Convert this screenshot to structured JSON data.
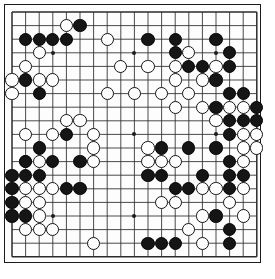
{
  "app": {
    "title": "Go board position",
    "board_type": "go-board",
    "size": 19
  },
  "board": {
    "columns": 19,
    "rows": 19,
    "line_color": "#2a2a2a",
    "border_color": "#1c1c1c",
    "background_color": "#fdfdfd",
    "black_color": "#151515",
    "white_color": "#ffffff",
    "origin_x": 7,
    "origin_y": 7,
    "spacing": 13.6,
    "stone_radius": 6.6,
    "star_points": [
      [
        4,
        4
      ],
      [
        10,
        4
      ],
      [
        16,
        4
      ],
      [
        4,
        10
      ],
      [
        10,
        10
      ],
      [
        16,
        10
      ],
      [
        4,
        16
      ],
      [
        10,
        16
      ],
      [
        16,
        16
      ]
    ]
  },
  "stones": {
    "black": [
      [
        6,
        2
      ],
      [
        2,
        3
      ],
      [
        3,
        3
      ],
      [
        4,
        3
      ],
      [
        5,
        3
      ],
      [
        11,
        3
      ],
      [
        13,
        3
      ],
      [
        16,
        3
      ],
      [
        13,
        4
      ],
      [
        17,
        4
      ],
      [
        14,
        5
      ],
      [
        15,
        5
      ],
      [
        17,
        5
      ],
      [
        2,
        6
      ],
      [
        16,
        6
      ],
      [
        3,
        7
      ],
      [
        17,
        7
      ],
      [
        18,
        7
      ],
      [
        16,
        8
      ],
      [
        19,
        8
      ],
      [
        17,
        9
      ],
      [
        18,
        9
      ],
      [
        19,
        9
      ],
      [
        5,
        10
      ],
      [
        17,
        10
      ],
      [
        3,
        11
      ],
      [
        12,
        11
      ],
      [
        14,
        11
      ],
      [
        16,
        11
      ],
      [
        2,
        12
      ],
      [
        4,
        12
      ],
      [
        6,
        12
      ],
      [
        17,
        12
      ],
      [
        1,
        13
      ],
      [
        2,
        13
      ],
      [
        3,
        13
      ],
      [
        11,
        13
      ],
      [
        12,
        13
      ],
      [
        15,
        13
      ],
      [
        17,
        13
      ],
      [
        18,
        13
      ],
      [
        1,
        14
      ],
      [
        5,
        14
      ],
      [
        6,
        14
      ],
      [
        13,
        14
      ],
      [
        14,
        14
      ],
      [
        17,
        14
      ],
      [
        1,
        15
      ],
      [
        1,
        16
      ],
      [
        2,
        16
      ],
      [
        16,
        16
      ],
      [
        17,
        17
      ],
      [
        11,
        18
      ],
      [
        12,
        18
      ],
      [
        13,
        18
      ],
      [
        17,
        18
      ]
    ],
    "white": [
      [
        5,
        2
      ],
      [
        8,
        3
      ],
      [
        3,
        4
      ],
      [
        14,
        4
      ],
      [
        2,
        5
      ],
      [
        9,
        5
      ],
      [
        11,
        5
      ],
      [
        13,
        5
      ],
      [
        16,
        5
      ],
      [
        1,
        6
      ],
      [
        3,
        6
      ],
      [
        4,
        6
      ],
      [
        13,
        6
      ],
      [
        15,
        6
      ],
      [
        1,
        7
      ],
      [
        8,
        7
      ],
      [
        10,
        7
      ],
      [
        12,
        7
      ],
      [
        14,
        7
      ],
      [
        13,
        8
      ],
      [
        15,
        8
      ],
      [
        17,
        8
      ],
      [
        18,
        8
      ],
      [
        5,
        9
      ],
      [
        6,
        9
      ],
      [
        16,
        9
      ],
      [
        2,
        10
      ],
      [
        4,
        10
      ],
      [
        7,
        10
      ],
      [
        18,
        10
      ],
      [
        19,
        10
      ],
      [
        7,
        11
      ],
      [
        11,
        11
      ],
      [
        18,
        11
      ],
      [
        19,
        11
      ],
      [
        2,
        12
      ],
      [
        3,
        12
      ],
      [
        7,
        12
      ],
      [
        11,
        12
      ],
      [
        12,
        12
      ],
      [
        18,
        12
      ],
      [
        13,
        12
      ],
      [
        2,
        14
      ],
      [
        3,
        14
      ],
      [
        4,
        14
      ],
      [
        15,
        14
      ],
      [
        16,
        14
      ],
      [
        18,
        14
      ],
      [
        2,
        15
      ],
      [
        3,
        15
      ],
      [
        12,
        15
      ],
      [
        13,
        15
      ],
      [
        17,
        15
      ],
      [
        3,
        16
      ],
      [
        15,
        16
      ],
      [
        18,
        16
      ],
      [
        2,
        17
      ],
      [
        3,
        17
      ],
      [
        4,
        17
      ],
      [
        14,
        17
      ],
      [
        7,
        18
      ],
      [
        15,
        18
      ]
    ]
  }
}
